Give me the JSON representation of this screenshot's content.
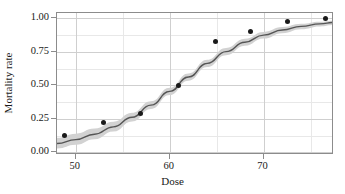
{
  "chart_data": {
    "type": "scatter",
    "title": "",
    "xlabel": "Dose",
    "ylabel": "Mortality rate",
    "xlim": [
      48.0,
      77.5
    ],
    "ylim": [
      -0.02,
      1.04
    ],
    "grid": true,
    "legend": false,
    "xticks": [
      50,
      60,
      70
    ],
    "xtick_labels": [
      "50",
      "60",
      "70"
    ],
    "yticks": [
      0.0,
      0.25,
      0.5,
      0.75,
      1.0
    ],
    "ytick_labels": [
      "0.00",
      "0.25",
      "0.50",
      "0.75",
      "1.00"
    ],
    "x_minor_ticks": [
      55,
      65,
      75
    ],
    "y_minor_ticks": [
      0.125,
      0.375,
      0.625,
      0.875
    ],
    "points": {
      "name": "Observed mortality rate",
      "x": [
        48.8,
        52.9,
        56.9,
        60.9,
        64.9,
        68.6,
        72.5,
        76.6
      ],
      "y": [
        0.125,
        0.22,
        0.29,
        0.5,
        0.83,
        0.9,
        0.98,
        1.0
      ],
      "marker": "circle",
      "color": "#1a1a1a",
      "size": 5
    },
    "fit_line": {
      "name": "Logistic fit",
      "color": "#555555",
      "width": 1.4,
      "x": [
        48.0,
        50.0,
        52.0,
        54.0,
        56.0,
        58.0,
        60.0,
        62.0,
        64.0,
        66.0,
        68.0,
        70.0,
        72.0,
        74.0,
        76.0,
        77.5
      ],
      "y": [
        0.066,
        0.095,
        0.135,
        0.19,
        0.262,
        0.352,
        0.455,
        0.562,
        0.664,
        0.752,
        0.822,
        0.875,
        0.913,
        0.94,
        0.959,
        0.969
      ]
    },
    "confidence_band": {
      "name": "95% confidence band",
      "color": "#d2d2d2",
      "x": [
        48.0,
        50.0,
        52.0,
        54.0,
        56.0,
        58.0,
        60.0,
        62.0,
        64.0,
        66.0,
        68.0,
        70.0,
        72.0,
        74.0,
        76.0,
        77.5
      ],
      "lower": [
        0.028,
        0.056,
        0.097,
        0.155,
        0.231,
        0.324,
        0.428,
        0.535,
        0.636,
        0.724,
        0.795,
        0.849,
        0.889,
        0.918,
        0.939,
        0.95
      ],
      "upper": [
        0.108,
        0.139,
        0.177,
        0.228,
        0.295,
        0.381,
        0.482,
        0.589,
        0.691,
        0.779,
        0.848,
        0.899,
        0.935,
        0.959,
        0.975,
        0.983
      ]
    }
  },
  "axes": {
    "frame_color": "#8c8c8c",
    "grid_major_color": "#cfcfcf",
    "grid_minor_color": "#e8e8e8"
  }
}
